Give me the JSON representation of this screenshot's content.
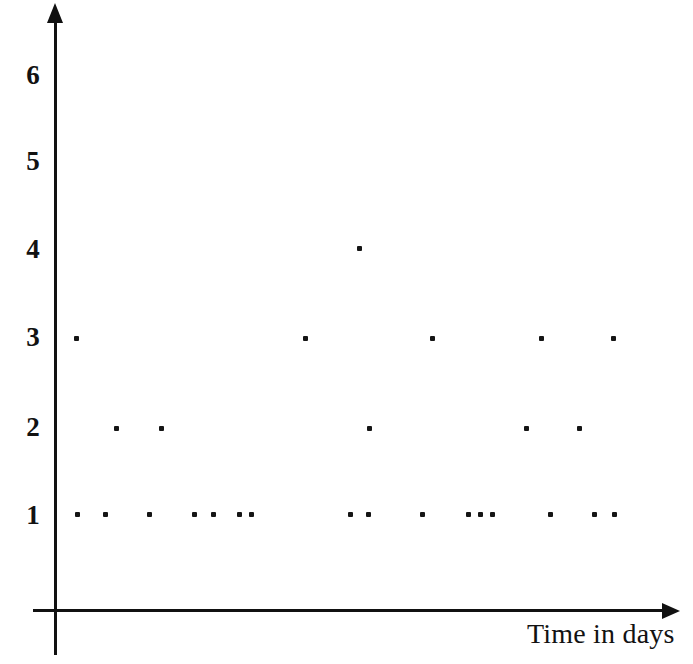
{
  "chart_data": {
    "type": "scatter",
    "title": "",
    "subtitle": "",
    "xlabel": "Time in days",
    "ylabel": "",
    "grid": false,
    "legend": null,
    "xticklabels": [],
    "yticklabels": [
      "1",
      "2",
      "3",
      "4",
      "5",
      "6"
    ],
    "ylim": [
      0,
      6.6
    ],
    "xlim": [
      0,
      23
    ],
    "axis_arrows": {
      "x": "right",
      "y": "up"
    },
    "marker": "square-dot",
    "marker_color": "#151515",
    "axis_color": "#111111",
    "background_color": "#ffffff",
    "points": [
      {
        "x": 0.7,
        "y": 3
      },
      {
        "x": 0.8,
        "y": 1
      },
      {
        "x": 1.8,
        "y": 1
      },
      {
        "x": 2.2,
        "y": 2
      },
      {
        "x": 3.4,
        "y": 1
      },
      {
        "x": 3.9,
        "y": 2
      },
      {
        "x": 5.0,
        "y": 1
      },
      {
        "x": 5.7,
        "y": 1
      },
      {
        "x": 6.7,
        "y": 1
      },
      {
        "x": 7.1,
        "y": 1
      },
      {
        "x": 9.2,
        "y": 3
      },
      {
        "x": 10.8,
        "y": 1
      },
      {
        "x": 11.5,
        "y": 1
      },
      {
        "x": 11.2,
        "y": 4
      },
      {
        "x": 11.6,
        "y": 2
      },
      {
        "x": 13.6,
        "y": 3
      },
      {
        "x": 13.3,
        "y": 1
      },
      {
        "x": 15.1,
        "y": 1
      },
      {
        "x": 15.5,
        "y": 1
      },
      {
        "x": 15.9,
        "y": 1
      },
      {
        "x": 17.4,
        "y": 1
      },
      {
        "x": 17.0,
        "y": 2
      },
      {
        "x": 17.2,
        "y": 3
      },
      {
        "x": 18.9,
        "y": 2
      },
      {
        "x": 19.5,
        "y": 1
      },
      {
        "x": 20.2,
        "y": 1
      },
      {
        "x": 19.8,
        "y": 3
      }
    ],
    "points_px": [
      {
        "left": 74,
        "top": 336
      },
      {
        "left": 75,
        "top": 512
      },
      {
        "left": 103,
        "top": 512
      },
      {
        "left": 114,
        "top": 426
      },
      {
        "left": 147,
        "top": 512
      },
      {
        "left": 159,
        "top": 426
      },
      {
        "left": 192,
        "top": 512
      },
      {
        "left": 211,
        "top": 512
      },
      {
        "left": 237,
        "top": 512
      },
      {
        "left": 249,
        "top": 512
      },
      {
        "left": 303,
        "top": 336
      },
      {
        "left": 348,
        "top": 512
      },
      {
        "left": 366,
        "top": 512
      },
      {
        "left": 357,
        "top": 246
      },
      {
        "left": 367,
        "top": 426
      },
      {
        "left": 430,
        "top": 336
      },
      {
        "left": 420,
        "top": 512
      },
      {
        "left": 466,
        "top": 512
      },
      {
        "left": 478,
        "top": 512
      },
      {
        "left": 490,
        "top": 512
      },
      {
        "left": 548,
        "top": 512
      },
      {
        "left": 524,
        "top": 426
      },
      {
        "left": 539,
        "top": 336
      },
      {
        "left": 577,
        "top": 426
      },
      {
        "left": 592,
        "top": 512
      },
      {
        "left": 612,
        "top": 512
      },
      {
        "left": 611,
        "top": 336
      }
    ],
    "ytick_px": [
      {
        "label": "1",
        "top": 502
      },
      {
        "label": "2",
        "top": 414
      },
      {
        "label": "3",
        "top": 324
      },
      {
        "label": "4",
        "top": 236
      },
      {
        "label": "5",
        "top": 148
      },
      {
        "label": "6",
        "top": 62
      }
    ]
  }
}
